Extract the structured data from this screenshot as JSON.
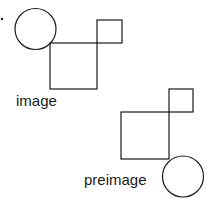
{
  "diagram": {
    "stroke_color": "#1a1a1a",
    "labels": {
      "image": "image",
      "preimage": "preimage"
    },
    "image_group": {
      "circle": {
        "cx": 35.5,
        "cy": 29,
        "r": 20.5
      },
      "big_square": {
        "x": 50,
        "y": 43,
        "w": 47,
        "h": 46
      },
      "small_square": {
        "x": 97,
        "y": 20,
        "w": 25,
        "h": 23
      }
    },
    "preimage_group": {
      "small_square": {
        "x": 169,
        "y": 89,
        "w": 24,
        "h": 23
      },
      "big_square": {
        "x": 121,
        "y": 112,
        "w": 48,
        "h": 47
      },
      "circle": {
        "cx": 183,
        "cy": 176.5,
        "r": 20.5
      }
    },
    "dot": {
      "cx": 2,
      "cy": 19,
      "r": 1.2
    }
  }
}
